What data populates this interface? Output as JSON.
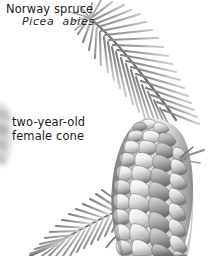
{
  "figure": {
    "background_color": "#ffffff",
    "width": 215,
    "height": 256,
    "style": "grayscale botanical illustration"
  },
  "labels": {
    "common_name": "Norway spruce",
    "scientific_name": "Picea  abies",
    "cone_caption_line1": "two-year-old",
    "cone_caption_line2": "female cone",
    "cone_caption": "two-year-old\nfemale cone",
    "text_color": "#1a1a1a"
  },
  "illustration": {
    "needle_color": "#9a9a9a",
    "needle_color_light": "#b8b8b8",
    "stem_color": "#5e5e5e",
    "scale_highlight": "#f2f2f2",
    "scale_midtone": "#c4c4c4",
    "scale_shadow": "#767676",
    "scale_outline": "#6b6b6b",
    "blur_cone_color": "#bcbcbc",
    "parts": [
      {
        "name": "upper-branch",
        "description": "needled twig arcing from upper-left to right",
        "needle_count": 46
      },
      {
        "name": "female-cone",
        "description": "two-year-old pendent cone with overlapping spiral scales",
        "scale_rows": 13,
        "scales_per_row": 5
      },
      {
        "name": "lower-branch",
        "description": "second needled twig emerging behind cone at lower left",
        "needle_count": 34
      },
      {
        "name": "background-cone",
        "description": "out-of-focus partial cone at far left edge"
      },
      {
        "name": "right-bract",
        "description": "small pointed needle projecting right of cone"
      }
    ]
  }
}
